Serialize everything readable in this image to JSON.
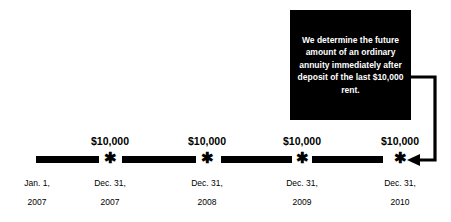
{
  "callout": {
    "text": "We determine the future amount of an ordinary annuity immediately after deposit of the last $10,000 rent.",
    "background_color": "#000000",
    "text_color": "#ffffff",
    "arrow_target": "dec-31-2010-marker"
  },
  "timeline": {
    "line_color": "#000000",
    "marker_glyph": "✱",
    "marker_label": "asterisk-marker",
    "segments": [
      {
        "id": "segment-1",
        "left": 36,
        "width": 63
      },
      {
        "id": "segment-2",
        "left": 122,
        "width": 74
      },
      {
        "id": "segment-3",
        "left": 221,
        "width": 71
      },
      {
        "id": "segment-4",
        "left": 312,
        "width": 71
      }
    ],
    "markers": [
      {
        "id": "marker-2007",
        "x": 110,
        "amount": "$10,000",
        "date_line1": "Dec. 31,",
        "date_line2": "2007"
      },
      {
        "id": "marker-2008",
        "x": 207,
        "amount": "$10,000",
        "date_line1": "Dec. 31,",
        "date_line2": "2008"
      },
      {
        "id": "marker-2009",
        "x": 302,
        "amount": "$10,000",
        "date_line1": "Dec. 31,",
        "date_line2": "2009"
      },
      {
        "id": "marker-2010",
        "x": 400,
        "amount": "$10,000",
        "date_line1": "Dec. 31,",
        "date_line2": "2010"
      }
    ],
    "start_label": {
      "id": "start-jan-1-2007",
      "x": 36,
      "date_line1": "Jan. 1,",
      "date_line2": "2007"
    }
  }
}
